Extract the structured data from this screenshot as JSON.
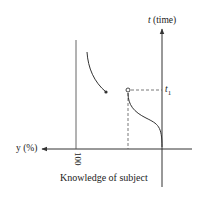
{
  "figure": {
    "type": "diagram",
    "colors": {
      "line": "#333333",
      "dashed": "#555555",
      "background": "#ffffff"
    },
    "axes": {
      "vertical": {
        "label_var": "t",
        "label_unit": "(time)",
        "direction": "up"
      },
      "horizontal": {
        "label_var": "y",
        "label_unit": "(%)",
        "direction": "left"
      }
    },
    "markers": {
      "t1_var": "t",
      "t1_sub": "1",
      "hundred": "100"
    },
    "caption": "Knowledge of subject",
    "curves": [
      {
        "name": "s-curve-before-t1",
        "description": "Knowledge rises from 0 at t=0 to a level at t1, ends with open circle"
      },
      {
        "name": "decay-curve-after-t1",
        "description": "Curve after t1 descending, ending at filled dot"
      }
    ],
    "guides": [
      {
        "name": "t1-dashed-horizontal"
      },
      {
        "name": "level-dashed-vertical"
      },
      {
        "name": "hundred-percent-line"
      }
    ]
  }
}
